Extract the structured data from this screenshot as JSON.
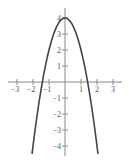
{
  "chart_data": {
    "type": "line",
    "title": "",
    "xlabel": "",
    "ylabel": "",
    "function": "y = 4 - 2x^2",
    "xlim": [
      -3.3,
      3.5
    ],
    "ylim": [
      -4.6,
      4.6
    ],
    "grid": false,
    "legend": null,
    "x_ticks": [
      -3,
      -2,
      -1,
      1,
      2,
      3
    ],
    "x_tick_labels": [
      "−3",
      "−2",
      "−1",
      "1",
      "2",
      "3"
    ],
    "y_ticks": [
      4,
      3,
      2,
      1,
      -1,
      -2,
      -3,
      -4
    ],
    "y_tick_labels": [
      "4",
      "3",
      "2",
      "1",
      "−1",
      "−2",
      "−3",
      "−4"
    ],
    "series": [
      {
        "name": "parabola",
        "x": [
          -2.06,
          -2,
          -1.5,
          -1.41,
          -1,
          -0.5,
          0,
          0.5,
          1,
          1.41,
          1.5,
          2,
          2.06
        ],
        "y": [
          -4.49,
          -4,
          -0.5,
          0,
          2,
          3.5,
          4,
          3.5,
          2,
          0,
          -0.5,
          -4,
          -4.49
        ],
        "color": "#444444"
      }
    ]
  },
  "style": {
    "axis_color": "#888888",
    "curve_color": "#444444",
    "label_color": "#555555"
  }
}
